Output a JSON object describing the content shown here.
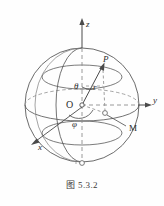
{
  "figure": {
    "caption": "图 5.3.2",
    "caption_number": "5.3.2",
    "title_prefix": "图"
  },
  "colors": {
    "background": "#fefefe",
    "stroke": "#4a4a4a",
    "stroke_light": "#8a8a8a",
    "label": "#2b2b2b",
    "dashed": "#8f8f8f"
  },
  "axes": [
    {
      "name": "z",
      "label": "z",
      "direction": "up"
    },
    {
      "name": "y",
      "label": "y",
      "direction": "right"
    },
    {
      "name": "x",
      "label": "x",
      "direction": "down-left"
    }
  ],
  "points": [
    {
      "name": "origin",
      "label": "O"
    },
    {
      "name": "point-p",
      "label": "P"
    },
    {
      "name": "point-m",
      "label": "M"
    }
  ],
  "measures": [
    {
      "name": "radius",
      "label": "r"
    },
    {
      "name": "polar-angle",
      "label": "θ"
    },
    {
      "name": "azimuth-angle",
      "label": "φ"
    }
  ],
  "labels": {
    "z": "z",
    "y": "y",
    "x": "x",
    "O": "O",
    "P": "P",
    "M": "M",
    "r": "r",
    "theta": "θ",
    "phi": "φ"
  }
}
